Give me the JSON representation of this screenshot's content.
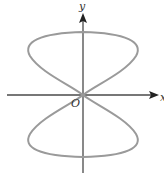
{
  "figure": {
    "type": "polar-curve-diagram",
    "axes": {
      "x_label": "x",
      "y_label": "y",
      "origin_label": "O"
    },
    "colors": {
      "curve": "#9a9a9a",
      "axis": "#4a4a4a",
      "label": "#333333",
      "background": "#ffffff"
    }
  }
}
